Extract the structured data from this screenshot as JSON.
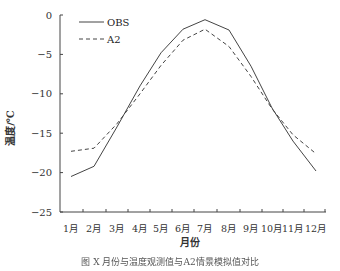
{
  "chart_data": {
    "type": "line",
    "title": "",
    "xlabel": "月份",
    "ylabel": "温度/℃",
    "categories": [
      "1月",
      "2月",
      "3月",
      "4月",
      "5月",
      "6月",
      "7月",
      "8月",
      "9月",
      "10月",
      "11月",
      "12月"
    ],
    "series": [
      {
        "name": "OBS",
        "style": "solid",
        "values": [
          -20.5,
          -19.2,
          -14.2,
          -9.0,
          -4.8,
          -1.8,
          -0.6,
          -1.9,
          -6.5,
          -11.8,
          -16.0,
          -19.8
        ]
      },
      {
        "name": "A2",
        "style": "dashed",
        "values": [
          -17.3,
          -16.9,
          -13.8,
          -10.0,
          -6.4,
          -3.2,
          -1.8,
          -4.0,
          -7.8,
          -11.9,
          -15.2,
          -17.6
        ]
      }
    ],
    "yticks": [
      0,
      -5,
      -10,
      -15,
      -20,
      -25
    ],
    "ylim": [
      -25,
      0
    ],
    "grid": false,
    "legend_position": "upper-left",
    "line_color": "#444444"
  },
  "caption": "图 X   月份与温度观测值与A2情景模拟值对比"
}
